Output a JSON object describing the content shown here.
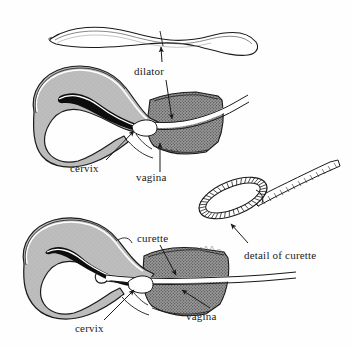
{
  "figure": {
    "background_color": "#fefefe",
    "ink_color": "#1a1a1a",
    "myometrium_color": "#b5b5b5",
    "cavity_color": "#0d0d0d",
    "vagina_color": "#8e8e8e",
    "instrument_fill": "#ffffff"
  },
  "labels": {
    "dilator": "dilator",
    "cervix_upper": "cervix",
    "vagina_upper": "vagina",
    "curette": "curette",
    "detail_of_curette": "detail of curette",
    "cervix_lower": "cervix",
    "vagina_lower": "vagina"
  },
  "panels": [
    {
      "name": "dilator-instrument",
      "description": "Long slender S-curved metal dilator rod shown in outline at top of figure"
    },
    {
      "name": "upper-uterus-diagram",
      "description": "Sagittal cross-section of uterus with dilator passing through vagina and cervix",
      "callouts": [
        "dilator",
        "cervix",
        "vagina"
      ]
    },
    {
      "name": "lower-uterus-diagram",
      "description": "Sagittal cross-section of uterus with curette inserted through cervix into uterine cavity",
      "callouts": [
        "curette",
        "cervix",
        "vagina"
      ]
    },
    {
      "name": "curette-detail",
      "description": "Enlarged detail of the curette loop tip, an oval serrated ring on a hatched shaft",
      "callouts": [
        "detail of curette"
      ]
    }
  ]
}
